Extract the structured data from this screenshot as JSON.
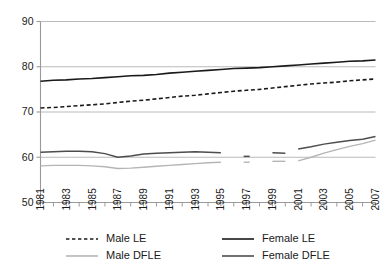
{
  "chart_data": {
    "type": "line",
    "title": "",
    "subtitle": "",
    "xlabel": "",
    "ylabel": "",
    "xlim": [
      1981,
      2007
    ],
    "ylim": [
      50,
      90
    ],
    "yticks": [
      50,
      60,
      70,
      80,
      90
    ],
    "ytick_labels": [
      "50",
      "60",
      "70",
      "80",
      "90"
    ],
    "xticks": [
      1981,
      1982,
      1983,
      1984,
      1985,
      1986,
      1987,
      1988,
      1989,
      1990,
      1991,
      1992,
      1993,
      1994,
      1995,
      1996,
      1997,
      1998,
      1999,
      2000,
      2001,
      2002,
      2003,
      2004,
      2005,
      2006,
      2007
    ],
    "xtick_labels": [
      "1981",
      "1983",
      "1985",
      "1987",
      "1989",
      "1991",
      "1993",
      "1995",
      "1997",
      "1999",
      "2001",
      "2003",
      "2005",
      "2007"
    ],
    "xtick_label_years": [
      1981,
      1983,
      1985,
      1987,
      1989,
      1991,
      1993,
      1995,
      1997,
      1999,
      2001,
      2003,
      2005,
      2007
    ],
    "grid": "horizontal",
    "legend_position": "bottom",
    "series": [
      {
        "name": "Male LE",
        "style": "dashed",
        "color": "#1a1a1a",
        "width": 1.6,
        "x": [
          1981,
          1982,
          1983,
          1984,
          1985,
          1986,
          1987,
          1988,
          1989,
          1990,
          1991,
          1992,
          1993,
          1994,
          1995,
          1996,
          1997,
          1998,
          1999,
          2000,
          2001,
          2002,
          2003,
          2004,
          2005,
          2006,
          2007
        ],
        "values": [
          70.9,
          71.0,
          71.2,
          71.4,
          71.6,
          71.8,
          72.1,
          72.4,
          72.6,
          72.9,
          73.2,
          73.5,
          73.7,
          74.0,
          74.3,
          74.6,
          74.8,
          75.0,
          75.3,
          75.6,
          75.9,
          76.2,
          76.4,
          76.6,
          76.9,
          77.1,
          77.3
        ]
      },
      {
        "name": "Female LE",
        "style": "solid",
        "color": "#1a1a1a",
        "width": 1.6,
        "x": [
          1981,
          1982,
          1983,
          1984,
          1985,
          1986,
          1987,
          1988,
          1989,
          1990,
          1991,
          1992,
          1993,
          1994,
          1995,
          1996,
          1997,
          1998,
          1999,
          2000,
          2001,
          2002,
          2003,
          2004,
          2005,
          2006,
          2007
        ],
        "values": [
          76.8,
          77.0,
          77.1,
          77.3,
          77.4,
          77.6,
          77.8,
          78.0,
          78.1,
          78.3,
          78.6,
          78.8,
          79.0,
          79.2,
          79.4,
          79.6,
          79.7,
          79.8,
          80.0,
          80.2,
          80.4,
          80.6,
          80.8,
          81.0,
          81.2,
          81.3,
          81.5
        ]
      },
      {
        "name": "Male DFLE",
        "style": "solid",
        "color": "#b5b5b5",
        "width": 1.4,
        "x": [
          1981,
          1982,
          1983,
          1984,
          1985,
          1986,
          1987,
          1988,
          1989,
          1990,
          1991,
          1992,
          1993,
          1994,
          1995
        ],
        "values": [
          58.1,
          58.2,
          58.2,
          58.2,
          58.1,
          57.9,
          57.5,
          57.6,
          57.8,
          58.0,
          58.2,
          58.4,
          58.6,
          58.8,
          58.9
        ]
      },
      {
        "name": "Male DFLE",
        "style": "solid",
        "color": "#b5b5b5",
        "width": 1.4,
        "x": [
          1997
        ],
        "values": [
          58.9
        ]
      },
      {
        "name": "Male DFLE",
        "style": "solid",
        "color": "#b5b5b5",
        "width": 1.4,
        "x": [
          1999,
          2000
        ],
        "values": [
          59.1,
          59.1
        ]
      },
      {
        "name": "Male DFLE",
        "style": "solid",
        "color": "#b5b5b5",
        "width": 1.4,
        "x": [
          2001,
          2002,
          2003,
          2004,
          2005,
          2006,
          2007
        ],
        "values": [
          59.2,
          60.0,
          60.9,
          61.7,
          62.4,
          63.0,
          63.8
        ]
      },
      {
        "name": "Female DFLE",
        "style": "solid",
        "color": "#4d4d4d",
        "width": 1.5,
        "x": [
          1981,
          1982,
          1983,
          1984,
          1985,
          1986,
          1987,
          1988,
          1989,
          1990,
          1991,
          1992,
          1993,
          1994,
          1995
        ],
        "values": [
          61.1,
          61.2,
          61.3,
          61.3,
          61.2,
          60.8,
          60.0,
          60.3,
          60.7,
          60.9,
          61.0,
          61.1,
          61.2,
          61.1,
          61.0
        ]
      },
      {
        "name": "Female DFLE",
        "style": "solid",
        "color": "#4d4d4d",
        "width": 1.5,
        "x": [
          1997
        ],
        "values": [
          60.2
        ]
      },
      {
        "name": "Female DFLE",
        "style": "solid",
        "color": "#4d4d4d",
        "width": 1.5,
        "x": [
          1999,
          2000
        ],
        "values": [
          61.0,
          60.9
        ]
      },
      {
        "name": "Female DFLE",
        "style": "solid",
        "color": "#4d4d4d",
        "width": 1.5,
        "x": [
          2001,
          2002,
          2003,
          2004,
          2005,
          2006,
          2007
        ],
        "values": [
          61.8,
          62.3,
          62.9,
          63.3,
          63.7,
          64.0,
          64.6
        ]
      }
    ],
    "legend": [
      {
        "label": "Male LE",
        "style": "dashed",
        "color": "#1a1a1a"
      },
      {
        "label": "Female LE",
        "style": "solid",
        "color": "#1a1a1a"
      },
      {
        "label": "Male DFLE",
        "style": "solid",
        "color": "#b5b5b5"
      },
      {
        "label": "Female DFLE",
        "style": "solid",
        "color": "#4d4d4d"
      }
    ],
    "colors": {
      "axis": "#9a9a9a",
      "grid": "#a8a8a8",
      "text": "#1a1a1a",
      "male_le": "#1a1a1a",
      "female_le": "#1a1a1a",
      "male_dfle": "#b5b5b5",
      "female_dfle": "#4d4d4d",
      "background": "#ffffff"
    }
  }
}
